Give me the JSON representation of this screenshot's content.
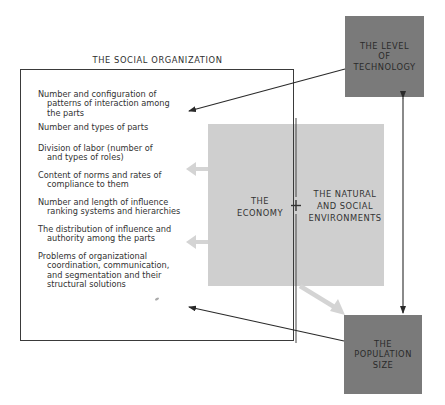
{
  "diagram": {
    "social_organization": {
      "title": "THE SOCIAL ORGANIZATION",
      "items": [
        {
          "line1": "Number and configuration of",
          "line2": "patterns of interaction among",
          "line3": "the parts"
        },
        {
          "line1": "Number and types of parts"
        },
        {
          "line1": "Division of labor (number of",
          "line2": "and types of roles)"
        },
        {
          "line1": "Content of norms and rates of",
          "line2": "compliance to them"
        },
        {
          "line1": "Number and length of influence",
          "line2": "ranking systems and hierarchies"
        },
        {
          "line1": "The distribution of influence and",
          "line2": "authority among the parts"
        },
        {
          "line1": "Problems of organizational",
          "line2": "coordination, communication,",
          "line3": "and segmentation and their",
          "line4": "structural solutions"
        }
      ]
    },
    "economy": {
      "line1": "THE",
      "line2": "ECONOMY"
    },
    "plus_symbol": "+",
    "environments": {
      "line1": "THE NATURAL",
      "line2": "AND SOCIAL",
      "line3": "ENVIRONMENTS"
    },
    "technology": {
      "line1": "THE LEVEL",
      "line2": "OF",
      "line3": "TECHNOLOGY"
    },
    "population": {
      "line1": "THE",
      "line2": "POPULATION",
      "line3": "SIZE"
    },
    "colors": {
      "dark_box": "#7a7a7a",
      "economy_box": "#cfcfcf",
      "arrow_light": "#d4d4d4",
      "line": "#2a2a2a"
    }
  }
}
